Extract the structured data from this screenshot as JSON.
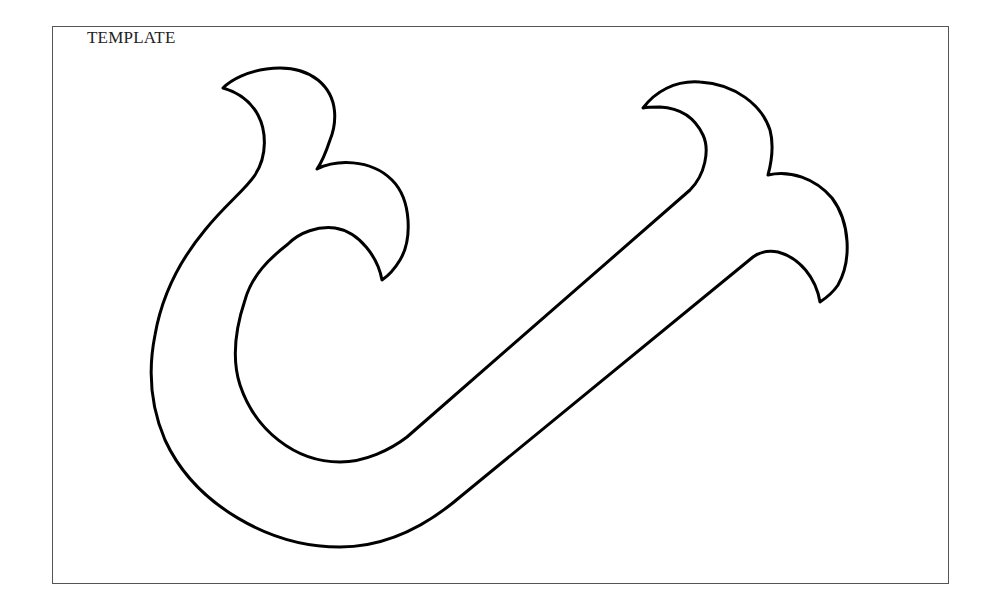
{
  "diagram": {
    "title": "TEMPLATE",
    "shape": {
      "description": "J-shaped outline with two forked flame-like lobes at each arm end",
      "stroke_color": "#000000",
      "fill_color": "#ffffff",
      "stroke_width": 3
    },
    "frame": {
      "border_color": "#555555"
    }
  }
}
